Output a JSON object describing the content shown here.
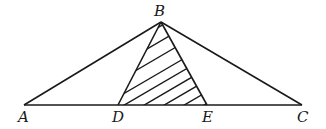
{
  "diagram": {
    "type": "triangle-with-shaded-subtriangle",
    "points": {
      "A": {
        "label": "A",
        "x": 24,
        "y": 105
      },
      "B": {
        "label": "B",
        "x": 161,
        "y": 22
      },
      "C": {
        "label": "C",
        "x": 302,
        "y": 105
      },
      "D": {
        "label": "D",
        "x": 118,
        "y": 105
      },
      "E": {
        "label": "E",
        "x": 207,
        "y": 105
      }
    },
    "segments": [
      "AB",
      "BC",
      "AC",
      "BD",
      "BE"
    ],
    "shaded_region": "triangle BDE (hatched)",
    "colors": {
      "stroke": "#1a1a1a",
      "background": "#ffffff"
    }
  }
}
